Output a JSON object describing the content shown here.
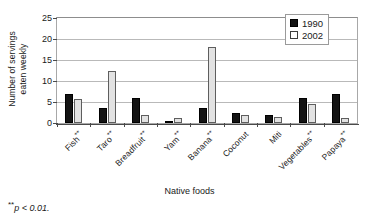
{
  "chart_data": {
    "type": "bar",
    "title": "",
    "xlabel": "Native foods",
    "ylabel": "Number of servings\neaten weekly",
    "ylim": [
      0,
      25
    ],
    "yticks": [
      0,
      5,
      10,
      15,
      20,
      25
    ],
    "grid": true,
    "legend_position": "top-right",
    "categories": [
      "Fish",
      "Taro",
      "Breadfruit",
      "Yam",
      "Banana",
      "Coconut",
      "Miti",
      "Vegetables",
      "Papaya"
    ],
    "category_significance": [
      "**",
      "**",
      "**",
      "**",
      "**",
      "",
      "",
      "**",
      "**"
    ],
    "series": [
      {
        "name": "1990",
        "color": "#131313",
        "values": [
          7.0,
          3.5,
          6.0,
          0.4,
          3.5,
          2.5,
          1.8,
          6.0,
          7.0
        ]
      },
      {
        "name": "2002",
        "color": "#e2e2e2",
        "values": [
          5.8,
          12.5,
          2.0,
          1.2,
          18.0,
          2.0,
          1.4,
          4.6,
          1.2
        ]
      }
    ],
    "footnote": "p < 0.01.",
    "footnote_marker": "**"
  }
}
